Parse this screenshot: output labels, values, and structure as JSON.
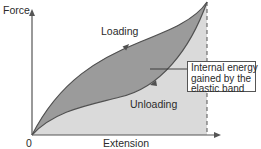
{
  "diagram": {
    "y_axis_label": "Force",
    "x_axis_label": "Extension",
    "origin_label": "0",
    "curves": [
      {
        "name": "Loading",
        "direction": "up"
      },
      {
        "name": "Unloading",
        "direction": "down"
      }
    ],
    "annotation": {
      "lines": [
        "Internal energy",
        "gained by the",
        "elastic band"
      ]
    },
    "colors": {
      "loop_fill": "#9a9a9a",
      "under_curve_fill": "#d9d9d9",
      "curve_stroke": "#555555",
      "axis": "#555555"
    }
  }
}
